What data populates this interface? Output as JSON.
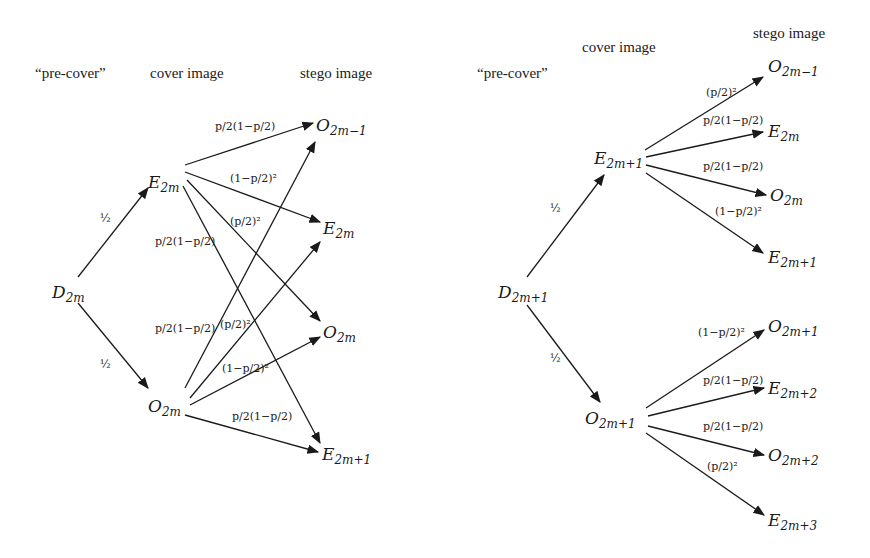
{
  "left": {
    "headers": {
      "pre_cover": "“pre-cover”",
      "cover": "cover image",
      "stego": "stego image"
    },
    "nodes": {
      "d2m": {
        "sym": "D",
        "sub": "2m"
      },
      "e2m": {
        "sym": "E",
        "sub": "2m"
      },
      "o2m": {
        "sym": "O",
        "sub": "2m"
      },
      "t_o2m_1": {
        "sym": "O",
        "sub": "2m−1"
      },
      "t_e2m": {
        "sym": "E",
        "sub": "2m"
      },
      "t_o2m": {
        "sym": "O",
        "sub": "2m"
      },
      "t_e2m_1": {
        "sym": "E",
        "sub": "2m+1"
      }
    },
    "edges": {
      "d_to_e": "½",
      "d_to_o": "½",
      "e_to_o2m_1": "p/2(1−p/2)",
      "e_to_e2m": "(1−p/2)²",
      "e_to_o2m": "(p/2)²",
      "e_to_e2m_1": "p/2(1−p/2)",
      "o_to_o2m_1": "p/2(1−p/2)",
      "o_to_e2m": "(p/2)²",
      "o_to_o2m": "(1−p/2)²",
      "o_to_e2m_1": "p/2(1−p/2)"
    }
  },
  "right": {
    "headers": {
      "pre_cover": "“pre-cover”",
      "cover": "cover image",
      "stego": "stego image"
    },
    "nodes": {
      "d2m1": {
        "sym": "D",
        "sub": "2m+1"
      },
      "e2m1": {
        "sym": "E",
        "sub": "2m+1"
      },
      "o2m1": {
        "sym": "O",
        "sub": "2m+1"
      },
      "t_o2m_1": {
        "sym": "O",
        "sub": "2m−1"
      },
      "t_e2m": {
        "sym": "E",
        "sub": "2m"
      },
      "t_o2m": {
        "sym": "O",
        "sub": "2m"
      },
      "t_e2m1": {
        "sym": "E",
        "sub": "2m+1"
      },
      "t_o2m1": {
        "sym": "O",
        "sub": "2m+1"
      },
      "t_e2m2": {
        "sym": "E",
        "sub": "2m+2"
      },
      "t_o2m2": {
        "sym": "O",
        "sub": "2m+2"
      },
      "t_e2m3": {
        "sym": "E",
        "sub": "2m+3"
      }
    },
    "edges": {
      "d_to_e": "½",
      "d_to_o": "½",
      "e_to_o2m_1": "(p/2)²",
      "e_to_e2m": "p/2(1−p/2)",
      "e_to_o2m": "p/2(1−p/2)",
      "e_to_e2m1": "(1−p/2)²",
      "o_to_o2m1": "(1−p/2)²",
      "o_to_e2m2": "p/2(1−p/2)",
      "o_to_o2m2": "p/2(1−p/2)",
      "o_to_e2m3": "(p/2)²"
    }
  }
}
